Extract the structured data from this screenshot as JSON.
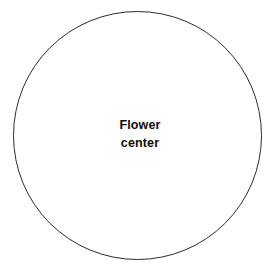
{
  "diagram": {
    "background_color": "#ffffff",
    "shapes": [
      {
        "name": "flower-center-circle",
        "type": "circle",
        "center_x": 138,
        "center_y": 136,
        "radius": 125,
        "stroke_color": "#2b2b2b",
        "stroke_width": 1,
        "fill_color": "#ffffff"
      }
    ],
    "labels": {
      "center": {
        "line1": "Flower",
        "line2": "center",
        "color": "#0d0d0d",
        "bold": true,
        "x": 140,
        "y": 134
      }
    }
  }
}
